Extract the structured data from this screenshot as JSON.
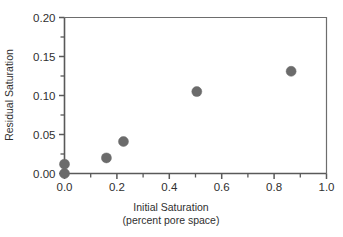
{
  "chart_data": {
    "type": "scatter",
    "title": "",
    "xlabel": "Initial Saturation",
    "xlabel_line2": "(percent pore space)",
    "ylabel": "Residual Saturation",
    "xlim": [
      0.0,
      1.0
    ],
    "ylim": [
      0.0,
      0.2
    ],
    "grid": false,
    "legend": null,
    "x_tick_labels": [
      "0.0",
      "0.2",
      "0.4",
      "0.6",
      "0.8",
      "1.0"
    ],
    "x_tick_values": [
      0.0,
      0.2,
      0.4,
      0.6,
      0.8,
      1.0
    ],
    "x_minor_tick_values": [
      0.1,
      0.3,
      0.5,
      0.7,
      0.9
    ],
    "y_tick_labels": [
      "0.00",
      "0.05",
      "0.10",
      "0.15",
      "0.20"
    ],
    "y_tick_values": [
      0.0,
      0.05,
      0.1,
      0.15,
      0.2
    ],
    "y_minor_tick_values": [
      0.025,
      0.075,
      0.125,
      0.175
    ],
    "marker_color": "#6b6b6b",
    "marker_shape": "circle",
    "marker_size_px": 10,
    "points": [
      {
        "x": 0.0,
        "y": 0.0
      },
      {
        "x": 0.0,
        "y": 0.012
      },
      {
        "x": 0.16,
        "y": 0.02
      },
      {
        "x": 0.225,
        "y": 0.041
      },
      {
        "x": 0.505,
        "y": 0.105
      },
      {
        "x": 0.865,
        "y": 0.131
      }
    ]
  },
  "colors": {
    "axis": "#595959",
    "frame": "#6d6d6d",
    "text": "#2f2f2f",
    "marker": "#6b6b6b",
    "background": "#ffffff"
  }
}
